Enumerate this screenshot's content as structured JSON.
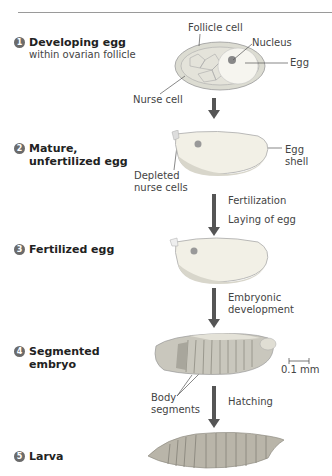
{
  "steps": [
    {
      "num": "1",
      "title": "Developing egg",
      "subtitle": "within ovarian follicle"
    },
    {
      "num": "2",
      "title": "Mature,",
      "title2": "unfertilized egg"
    },
    {
      "num": "3",
      "title": "Fertilized egg"
    },
    {
      "num": "4",
      "title": "Segmented",
      "title2": "embryo"
    },
    {
      "num": "5",
      "title": "Larva"
    }
  ],
  "labels": {
    "follicle_cell": "Follicle cell",
    "nucleus": "Nucleus",
    "egg": "Egg",
    "nurse_cell": "Nurse cell",
    "depleted_1": "Depleted",
    "depleted_2": "nurse cells",
    "egg_shell_1": "Egg",
    "egg_shell_2": "shell",
    "body_segments_1": "Body",
    "body_segments_2": "segments",
    "scale": "0.1 mm"
  },
  "transitions": {
    "fertilization": "Fertilization",
    "laying": "Laying of egg",
    "embryonic_1": "Embryonic",
    "embryonic_2": "development",
    "hatching": "Hatching"
  },
  "colors": {
    "step_circle": "#6b6b6b",
    "arrow": "#555555",
    "egg_fill": "#f2f0e6",
    "follicle_fill": "#dcdcd2",
    "larva_fill": "#b9b5a9"
  }
}
